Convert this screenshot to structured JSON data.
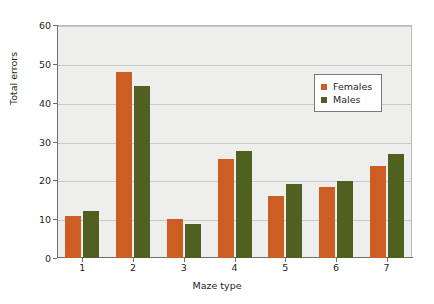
{
  "chart_data": {
    "type": "bar",
    "title": "",
    "xlabel": "Maze type",
    "ylabel": "Total errors",
    "categories": [
      "1",
      "2",
      "3",
      "4",
      "5",
      "6",
      "7"
    ],
    "series": [
      {
        "name": "Females",
        "color": "#cc5e24",
        "values": [
          10.8,
          47.8,
          10.0,
          25.4,
          16.0,
          18.4,
          23.7
        ]
      },
      {
        "name": "Males",
        "color": "#4f6021",
        "values": [
          12.0,
          44.3,
          8.8,
          27.5,
          19.1,
          19.8,
          26.8
        ]
      }
    ],
    "ylim": [
      0,
      60
    ],
    "yticks": [
      0,
      10,
      20,
      30,
      40,
      50,
      60
    ],
    "ytick_labels": [
      "0",
      "10",
      "20",
      "30",
      "40",
      "50",
      "60"
    ],
    "grid": true,
    "legend_position": "upper right",
    "plot_background": "#eeeeec"
  }
}
